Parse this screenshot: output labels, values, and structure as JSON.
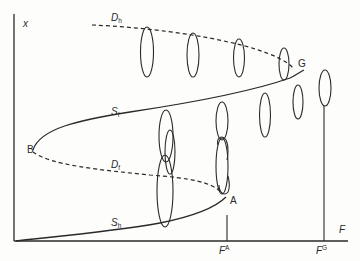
{
  "diagram": {
    "axes": {
      "y_label": "x",
      "x_label": "F",
      "x_ticks": [
        {
          "base": "F",
          "sup": "A"
        },
        {
          "base": "F",
          "sup": "G"
        }
      ]
    },
    "points": {
      "A": "A",
      "B": "B",
      "G": "G"
    },
    "branches": [
      {
        "id": "Dh",
        "base": "D",
        "sub": "h",
        "style": "dashed"
      },
      {
        "id": "Sf",
        "base": "S",
        "sub": "f",
        "style": "solid"
      },
      {
        "id": "Df",
        "base": "D",
        "sub": "f",
        "style": "dashed"
      },
      {
        "id": "Sh",
        "base": "S",
        "sub": "h",
        "style": "solid"
      }
    ],
    "colors": {
      "line": "#2a2a2a",
      "background": "#fdfdfc"
    }
  }
}
